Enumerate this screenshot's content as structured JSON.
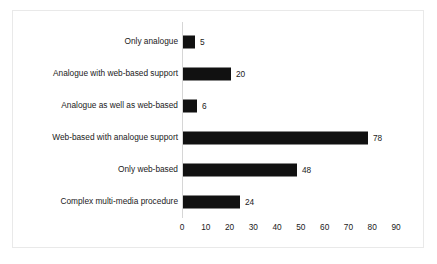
{
  "chart_data": {
    "type": "bar",
    "orientation": "horizontal",
    "title": "",
    "subtitle": "",
    "xlabel": "",
    "ylabel": "",
    "categories": [
      "Only analogue",
      "Analogue with web-based support",
      "Analogue as well as web-based",
      "Web-based with analogue support",
      "Only web-based",
      "Complex multi-media procedure"
    ],
    "values": [
      5,
      20,
      6,
      78,
      48,
      24
    ],
    "data_labels": [
      "5",
      "20",
      "6",
      "78",
      "48",
      "24"
    ],
    "xlim": [
      0,
      90
    ],
    "xticks": [
      0,
      10,
      20,
      30,
      40,
      50,
      60,
      70,
      80,
      90
    ],
    "xtick_labels": [
      "0",
      "10",
      "20",
      "30",
      "40",
      "50",
      "60",
      "70",
      "80",
      "90"
    ],
    "grid": false,
    "legend": false,
    "legend_position": "none",
    "bar_color": "#111111",
    "text_color": "#1a1a1a",
    "axis_color": "#d6d6d6",
    "frame_color": "#e9e9e9",
    "background_color": "#ffffff"
  }
}
